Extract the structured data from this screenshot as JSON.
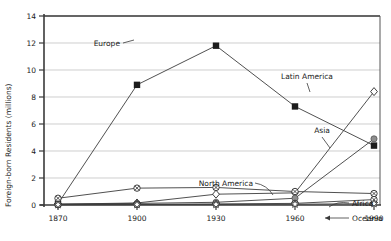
{
  "chart_data": {
    "type": "line",
    "title": "",
    "xlabel": "",
    "ylabel": "Foreign-born Residents (millions)",
    "x": [
      1870,
      1900,
      1930,
      1960,
      1990
    ],
    "xticklabels": [
      "1870",
      "1900",
      "1930",
      "1960",
      "1990"
    ],
    "yticklabels": [
      "0",
      "2",
      "4",
      "6",
      "8",
      "10",
      "12",
      "14"
    ],
    "yticks": [
      0,
      2,
      4,
      6,
      8,
      10,
      12,
      14
    ],
    "ylim": [
      0,
      14
    ],
    "xlim": [
      1870,
      1990
    ],
    "grid": "horizontal",
    "legend": "inline-annotations",
    "series": [
      {
        "name": "Europe",
        "marker": "filled-square",
        "values": [
          0.1,
          8.9,
          11.8,
          7.3,
          4.4
        ]
      },
      {
        "name": "Latin America",
        "marker": "open-diamond",
        "values": [
          0.06,
          0.15,
          0.8,
          0.9,
          8.4
        ]
      },
      {
        "name": "Asia",
        "marker": "gray-circle",
        "values": [
          0.07,
          0.12,
          0.2,
          0.5,
          4.9
        ]
      },
      {
        "name": "North America",
        "marker": "circled-x",
        "values": [
          0.5,
          1.25,
          1.3,
          1.0,
          0.85
        ]
      },
      {
        "name": "Africa",
        "marker": "circled-x",
        "values": [
          0.03,
          0.05,
          0.08,
          0.12,
          0.4
        ]
      },
      {
        "name": "Oceania",
        "marker": "star",
        "values": [
          0.02,
          0.03,
          0.04,
          0.06,
          0.1
        ]
      }
    ],
    "annotations": [
      {
        "label": "Europe",
        "x": 120,
        "y": 46,
        "anchor": "end"
      },
      {
        "label": "Latin America",
        "x": 307,
        "y": 79,
        "anchor": "middle"
      },
      {
        "label": "Asia",
        "x": 322,
        "y": 133,
        "anchor": "middle"
      },
      {
        "label": "North America",
        "x": 253,
        "y": 185,
        "anchor": "end"
      },
      {
        "label": "Africa",
        "x": 352,
        "y": 205,
        "anchor": "start"
      },
      {
        "label": "Oceania",
        "x": 352,
        "y": 220,
        "anchor": "start"
      }
    ]
  }
}
